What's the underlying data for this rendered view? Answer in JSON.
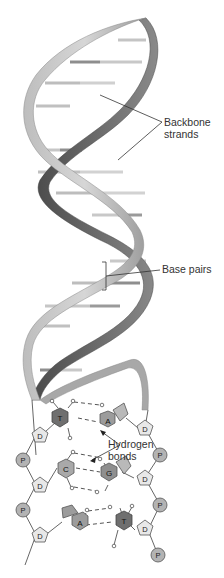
{
  "diagram": {
    "labels": {
      "backbone": [
        "Backbone",
        "strands"
      ],
      "base_pairs": "Base pairs",
      "hydrogen": [
        "Hydrogen",
        "bonds"
      ]
    },
    "symbols": {
      "phosphate": "P",
      "deoxyribose": "D"
    },
    "base_pairs": [
      {
        "left": "T",
        "right": "A"
      },
      {
        "left": "C",
        "right": "G"
      },
      {
        "left": "A",
        "right": "T"
      }
    ],
    "colors": {
      "strand_light": "#c8c8c8",
      "strand_mid": "#9a9a9a",
      "strand_dark": "#555555",
      "rung": "#c9c9c9",
      "rung_dark": "#8e8e8e",
      "phosphate_fill": "#b3b3b3",
      "sugar_fill": "#e8e8e8",
      "base_T": "#6f6f6f",
      "base_A": "#9c9c9c",
      "base_C": "#a9a9a9",
      "base_G": "#8f8f8f",
      "line": "#555555"
    }
  }
}
